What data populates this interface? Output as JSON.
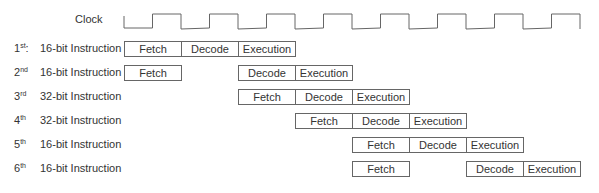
{
  "clock": {
    "label": "Clock",
    "start_x": 124,
    "period_px": 57,
    "cycles": 8,
    "low_y": 28,
    "high_y": 14,
    "color": "#666666"
  },
  "rows": [
    {
      "ordinal": "1",
      "suffix": "st",
      "punct": ":",
      "name": "16-bit Instruction",
      "stages": [
        {
          "label": "Fetch",
          "slot": 0
        },
        {
          "label": "Decode",
          "slot": 1
        },
        {
          "label": "Execution",
          "slot": 2
        }
      ]
    },
    {
      "ordinal": "2",
      "suffix": "nd",
      "punct": "",
      "name": "16-bit Instruction",
      "stages": [
        {
          "label": "Fetch",
          "slot": 0
        },
        {
          "label": "Decode",
          "slot": 2
        },
        {
          "label": "Execution",
          "slot": 3
        }
      ]
    },
    {
      "ordinal": "3",
      "suffix": "rd",
      "punct": "",
      "name": "32-bit Instruction",
      "stages": [
        {
          "label": "Fetch",
          "slot": 2
        },
        {
          "label": "Decode",
          "slot": 3
        },
        {
          "label": "Execution",
          "slot": 4
        }
      ]
    },
    {
      "ordinal": "4",
      "suffix": "th",
      "punct": "",
      "name": "32-bit Instruction",
      "stages": [
        {
          "label": "Fetch",
          "slot": 3
        },
        {
          "label": "Decode",
          "slot": 4
        },
        {
          "label": "Execution",
          "slot": 5
        }
      ]
    },
    {
      "ordinal": "5",
      "suffix": "th",
      "punct": "",
      "name": "16-bit Instruction",
      "stages": [
        {
          "label": "Fetch",
          "slot": 4
        },
        {
          "label": "Decode",
          "slot": 5
        },
        {
          "label": "Execution",
          "slot": 6
        }
      ]
    },
    {
      "ordinal": "6",
      "suffix": "th",
      "punct": "",
      "name": "16-bit Instruction",
      "stages": [
        {
          "label": "Fetch",
          "slot": 4
        },
        {
          "label": "Decode",
          "slot": 6
        },
        {
          "label": "Execution",
          "slot": 7
        }
      ]
    }
  ],
  "layout": {
    "first_row_top": 41,
    "row_spacing": 24
  }
}
